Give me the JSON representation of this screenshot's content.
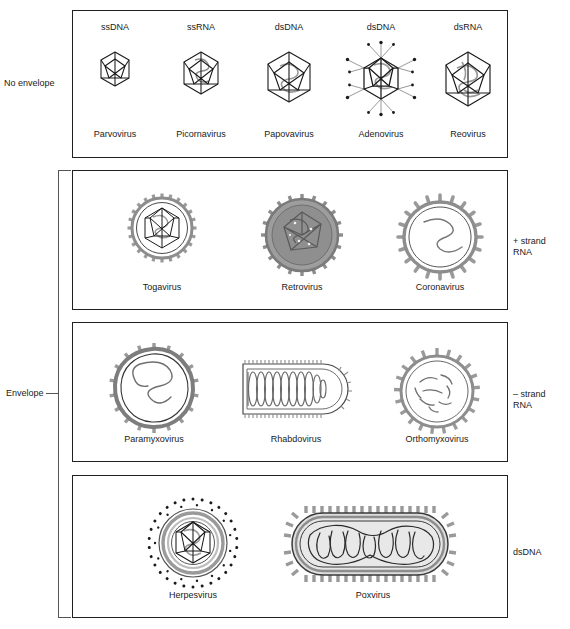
{
  "figure": {
    "title_cutoff": "",
    "row_labels": {
      "no_envelope": "No envelope",
      "envelope": "Envelope"
    },
    "right_labels": {
      "plus_strand_rna": "+ strand\nRNA",
      "plus_strand_rna_line1": "+ strand",
      "plus_strand_rna_line2": "RNA",
      "minus_strand_rna_line1": "– strand",
      "minus_strand_rna_line2": "RNA",
      "dsdna": "dsDNA"
    },
    "colors": {
      "outline": "#202020",
      "bracket": "#555555",
      "capsid_stroke": "#1a1a1a",
      "envelope_gray": "#9a9a9a",
      "fill_light": "#e2e2e2",
      "fill_mid": "#9d9d9d",
      "nucleic_acid": "#8d8d8d",
      "background": "#ffffff"
    }
  },
  "panels": [
    {
      "id": "no-envelope",
      "name": "No envelope",
      "viruses": [
        {
          "genome": "ssDNA",
          "name": "Parvovirus",
          "shape": "icosahedron"
        },
        {
          "genome": "ssRNA",
          "name": "Picornavirus",
          "shape": "icosahedron"
        },
        {
          "genome": "dsDNA",
          "name": "Papovavirus",
          "shape": "icosahedron"
        },
        {
          "genome": "dsDNA",
          "name": "Adenovirus",
          "shape": "icosahedron-with-fibers"
        },
        {
          "genome": "dsRNA",
          "name": "Reovirus",
          "shape": "icosahedron"
        }
      ]
    },
    {
      "id": "plus-strand-rna",
      "name": "+ strand RNA",
      "viruses": [
        {
          "name": "Togavirus",
          "shape": "enveloped-icosahedral"
        },
        {
          "name": "Retrovirus",
          "shape": "enveloped-spherical-dense"
        },
        {
          "name": "Coronavirus",
          "shape": "enveloped-spherical-clubbed"
        }
      ]
    },
    {
      "id": "minus-strand-rna",
      "name": "– strand RNA",
      "viruses": [
        {
          "name": "Paramyxovirus",
          "shape": "enveloped-pleomorphic"
        },
        {
          "name": "Rhabdovirus",
          "shape": "bullet-helical"
        },
        {
          "name": "Orthomyxovirus",
          "shape": "enveloped-segmented"
        }
      ]
    },
    {
      "id": "dsdna-enveloped",
      "name": "dsDNA",
      "viruses": [
        {
          "name": "Herpesvirus",
          "shape": "enveloped-icosahedral-layered"
        },
        {
          "name": "Poxvirus",
          "shape": "brick-shaped"
        }
      ]
    }
  ]
}
